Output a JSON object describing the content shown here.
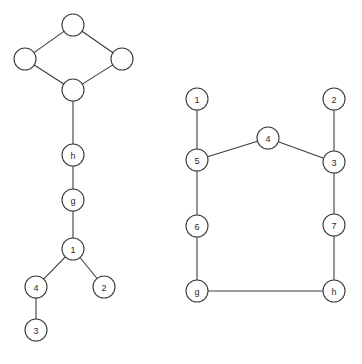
{
  "page": {
    "background_color": "#ffffff",
    "width": 362,
    "height": 364
  },
  "style": {
    "node_fill": "#ffffff",
    "node_stroke": "#3c3c3c",
    "edge_stroke": "#3c3c3c",
    "label_color": "#2b2b2b",
    "node_radius": 11,
    "stroke_width": 1.1,
    "label_font_size": 9
  },
  "chart_data": {
    "type": "diagram",
    "subtype": "node-link-graph",
    "title": "",
    "graphs": [
      {
        "name": "left-graph",
        "node_count": 10,
        "edge_count": 10,
        "nodes": [
          {
            "id": "L-top",
            "label": "",
            "x": 73,
            "y": 25
          },
          {
            "id": "L-left",
            "label": "",
            "x": 25,
            "y": 59
          },
          {
            "id": "L-right",
            "label": "",
            "x": 122,
            "y": 59
          },
          {
            "id": "L-bottom",
            "label": "",
            "x": 73,
            "y": 90
          },
          {
            "id": "L-h",
            "label": "h",
            "x": 73,
            "y": 155
          },
          {
            "id": "L-g",
            "label": "g",
            "x": 73,
            "y": 200
          },
          {
            "id": "L-1",
            "label": "1",
            "x": 73,
            "y": 249
          },
          {
            "id": "L-4",
            "label": "4",
            "x": 36,
            "y": 287
          },
          {
            "id": "L-2",
            "label": "2",
            "x": 104,
            "y": 287
          },
          {
            "id": "L-3",
            "label": "3",
            "x": 36,
            "y": 330
          }
        ],
        "edges": [
          {
            "from": "L-top",
            "to": "L-left"
          },
          {
            "from": "L-top",
            "to": "L-right"
          },
          {
            "from": "L-left",
            "to": "L-bottom"
          },
          {
            "from": "L-right",
            "to": "L-bottom"
          },
          {
            "from": "L-bottom",
            "to": "L-h"
          },
          {
            "from": "L-h",
            "to": "L-g"
          },
          {
            "from": "L-g",
            "to": "L-1"
          },
          {
            "from": "L-1",
            "to": "L-4"
          },
          {
            "from": "L-1",
            "to": "L-2"
          },
          {
            "from": "L-4",
            "to": "L-3"
          }
        ]
      },
      {
        "name": "right-graph",
        "node_count": 9,
        "edge_count": 9,
        "nodes": [
          {
            "id": "R-1",
            "label": "1",
            "x": 197,
            "y": 99
          },
          {
            "id": "R-2",
            "label": "2",
            "x": 334,
            "y": 99
          },
          {
            "id": "R-4",
            "label": "4",
            "x": 268,
            "y": 138
          },
          {
            "id": "R-5",
            "label": "5",
            "x": 197,
            "y": 160
          },
          {
            "id": "R-3",
            "label": "3",
            "x": 334,
            "y": 162
          },
          {
            "id": "R-6",
            "label": "6",
            "x": 197,
            "y": 226
          },
          {
            "id": "R-7",
            "label": "7",
            "x": 334,
            "y": 225
          },
          {
            "id": "R-g",
            "label": "g",
            "x": 197,
            "y": 291
          },
          {
            "id": "R-h",
            "label": "h",
            "x": 334,
            "y": 291
          }
        ],
        "edges": [
          {
            "from": "R-1",
            "to": "R-5"
          },
          {
            "from": "R-5",
            "to": "R-4"
          },
          {
            "from": "R-4",
            "to": "R-3"
          },
          {
            "from": "R-2",
            "to": "R-3"
          },
          {
            "from": "R-5",
            "to": "R-6"
          },
          {
            "from": "R-6",
            "to": "R-g"
          },
          {
            "from": "R-3",
            "to": "R-7"
          },
          {
            "from": "R-7",
            "to": "R-h"
          },
          {
            "from": "R-g",
            "to": "R-h"
          }
        ]
      }
    ]
  }
}
